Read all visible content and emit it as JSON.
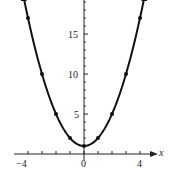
{
  "chart_data": {
    "type": "line",
    "title": "",
    "xlabel": "x",
    "ylabel": "",
    "x": [
      -4,
      -3,
      -2,
      -1,
      0,
      1,
      2,
      3,
      4
    ],
    "series": [
      {
        "name": "y = x^2 + 1",
        "values": [
          17,
          10,
          5,
          2,
          1,
          2,
          5,
          10,
          17
        ]
      }
    ],
    "x_ticks": [
      "-4",
      "0",
      "4"
    ],
    "y_ticks": [
      "5",
      "10",
      "15"
    ],
    "xlim": [
      -5,
      5
    ],
    "ylim": [
      0,
      19
    ],
    "grid": false,
    "legend": "none"
  },
  "labels": {
    "x_axis": "x",
    "xm4": "−4",
    "x0": "0",
    "x4": "4",
    "y5": "5",
    "y10": "10",
    "y15": "15"
  }
}
